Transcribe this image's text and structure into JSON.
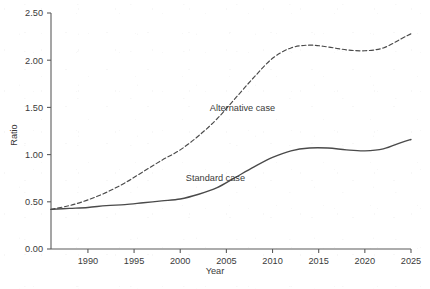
{
  "chart_data": {
    "type": "line",
    "title": "",
    "xlabel": "Year",
    "ylabel": "Ratio",
    "xlim": [
      1986,
      2025
    ],
    "ylim": [
      0.0,
      2.5
    ],
    "grid": false,
    "legend_position": "inline-annotation",
    "x_ticks": [
      1990,
      1995,
      2000,
      2005,
      2010,
      2015,
      2020,
      2025
    ],
    "x_tick_labels": [
      "1990",
      "1995",
      "2000",
      "2005",
      "2010",
      "2015",
      "2020",
      "2025"
    ],
    "y_ticks": [
      0.0,
      0.5,
      1.0,
      1.5,
      2.0,
      2.5
    ],
    "y_tick_labels": [
      "0.00",
      "0.50",
      "1.00",
      "1.50",
      "2.00",
      "2.50"
    ],
    "x": [
      1986,
      1988,
      1990,
      1992,
      1994,
      1996,
      1998,
      2000,
      2002,
      2004,
      2006,
      2008,
      2010,
      2012,
      2014,
      2016,
      2018,
      2020,
      2022,
      2024,
      2025
    ],
    "series": [
      {
        "name": "Alternative case",
        "style": "dashed",
        "color": "#4a4a4a",
        "values": [
          0.42,
          0.46,
          0.52,
          0.6,
          0.7,
          0.82,
          0.94,
          1.05,
          1.2,
          1.38,
          1.6,
          1.82,
          2.02,
          2.13,
          2.16,
          2.14,
          2.11,
          2.1,
          2.13,
          2.23,
          2.28
        ]
      },
      {
        "name": "Standard case",
        "style": "solid",
        "color": "#4a4a4a",
        "values": [
          0.42,
          0.43,
          0.44,
          0.46,
          0.47,
          0.49,
          0.51,
          0.53,
          0.58,
          0.65,
          0.76,
          0.87,
          0.97,
          1.04,
          1.07,
          1.07,
          1.05,
          1.04,
          1.06,
          1.13,
          1.16
        ]
      }
    ],
    "annotations": [
      {
        "text": "Alternative case",
        "x": 2003.2,
        "y": 1.46
      },
      {
        "text": "Standard case",
        "x": 2000.6,
        "y": 0.72
      }
    ]
  }
}
